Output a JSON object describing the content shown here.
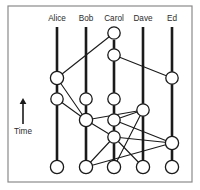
{
  "figure": {
    "title": "",
    "time_axis": {
      "label": "Time",
      "direction": "up",
      "arrow_icon": "up-arrow-icon",
      "x": 23,
      "arrow_top_y": 98,
      "arrow_bottom_y": 124,
      "label_y": 134
    },
    "frame": {
      "x": 8,
      "y": 6,
      "width": 184,
      "height": 176
    }
  },
  "chart_data": {
    "type": "diagram",
    "subtype": "process-time-space-diagram",
    "title": "",
    "xlabel": "",
    "ylabel": "Time",
    "grid": false,
    "legend": "none",
    "note": "Lamport-style space-time diagram: vertical lifelines per process, circles are events, diagonal lines are messages between processes.",
    "processes": [
      {
        "name": "Alice",
        "x": 57,
        "label_y": 21,
        "line_top": 27,
        "line_bottom": 172
      },
      {
        "name": "Bob",
        "x": 86,
        "label_y": 21,
        "line_top": 27,
        "line_bottom": 172
      },
      {
        "name": "Carol",
        "x": 114,
        "label_y": 21,
        "line_top": 40,
        "line_bottom": 172
      },
      {
        "name": "Dave",
        "x": 143,
        "label_y": 21,
        "line_top": 27,
        "line_bottom": 172
      },
      {
        "name": "Ed",
        "x": 172,
        "label_y": 21,
        "line_top": 27,
        "line_bottom": 172
      }
    ],
    "events": [
      {
        "id": "c1",
        "process": "Carol",
        "x": 114,
        "y": 33,
        "r": 6.2
      },
      {
        "id": "c2",
        "process": "Carol",
        "x": 114,
        "y": 55,
        "r": 6.2
      },
      {
        "id": "a1",
        "process": "Alice",
        "x": 57,
        "y": 78,
        "r": 6.6
      },
      {
        "id": "e1",
        "process": "Ed",
        "x": 172,
        "y": 78,
        "r": 6.2
      },
      {
        "id": "a2",
        "process": "Alice",
        "x": 57,
        "y": 99,
        "r": 6.2
      },
      {
        "id": "b1",
        "process": "Bob",
        "x": 86,
        "y": 99,
        "r": 6.2
      },
      {
        "id": "c3",
        "process": "Carol",
        "x": 114,
        "y": 99,
        "r": 6.2
      },
      {
        "id": "d1",
        "process": "Dave",
        "x": 143,
        "y": 110,
        "r": 6.2
      },
      {
        "id": "b2",
        "process": "Bob",
        "x": 86,
        "y": 120,
        "r": 6.6
      },
      {
        "id": "c4",
        "process": "Carol",
        "x": 114,
        "y": 120,
        "r": 6.2
      },
      {
        "id": "c5",
        "process": "Carol",
        "x": 114,
        "y": 137,
        "r": 6.2
      },
      {
        "id": "e2",
        "process": "Ed",
        "x": 172,
        "y": 143,
        "r": 6.6
      },
      {
        "id": "a3",
        "process": "Alice",
        "x": 57,
        "y": 167,
        "r": 6.6
      },
      {
        "id": "b3",
        "process": "Bob",
        "x": 86,
        "y": 167,
        "r": 6.6
      },
      {
        "id": "c6",
        "process": "Carol",
        "x": 114,
        "y": 167,
        "r": 6.6
      },
      {
        "id": "d2",
        "process": "Dave",
        "x": 143,
        "y": 167,
        "r": 6.6
      },
      {
        "id": "e3",
        "process": "Ed",
        "x": 172,
        "y": 167,
        "r": 6.6
      }
    ],
    "messages": [
      {
        "from": "c1",
        "to": "a1"
      },
      {
        "from": "c2",
        "to": "e1"
      },
      {
        "from": "a1",
        "to": "b2"
      },
      {
        "from": "a2",
        "to": "b2"
      },
      {
        "from": "c3",
        "to": "c4"
      },
      {
        "from": "c4",
        "to": "d1"
      },
      {
        "from": "d1",
        "to": "b2"
      },
      {
        "from": "c4",
        "to": "e2"
      },
      {
        "from": "b2",
        "to": "c5"
      },
      {
        "from": "c5",
        "to": "e2"
      },
      {
        "from": "c5",
        "to": "b3"
      },
      {
        "from": "e2",
        "to": "b3"
      },
      {
        "from": "c5",
        "to": "d2"
      },
      {
        "from": "d1",
        "to": "c6"
      }
    ],
    "colors": {
      "background": "#ffffff",
      "lifeline": "#1a1a1a",
      "message": "#1a1a1a",
      "node_fill": "#ffffff",
      "node_stroke": "#1a1a1a",
      "frame": "#8a8a8a",
      "text": "#2b2b2b"
    }
  }
}
